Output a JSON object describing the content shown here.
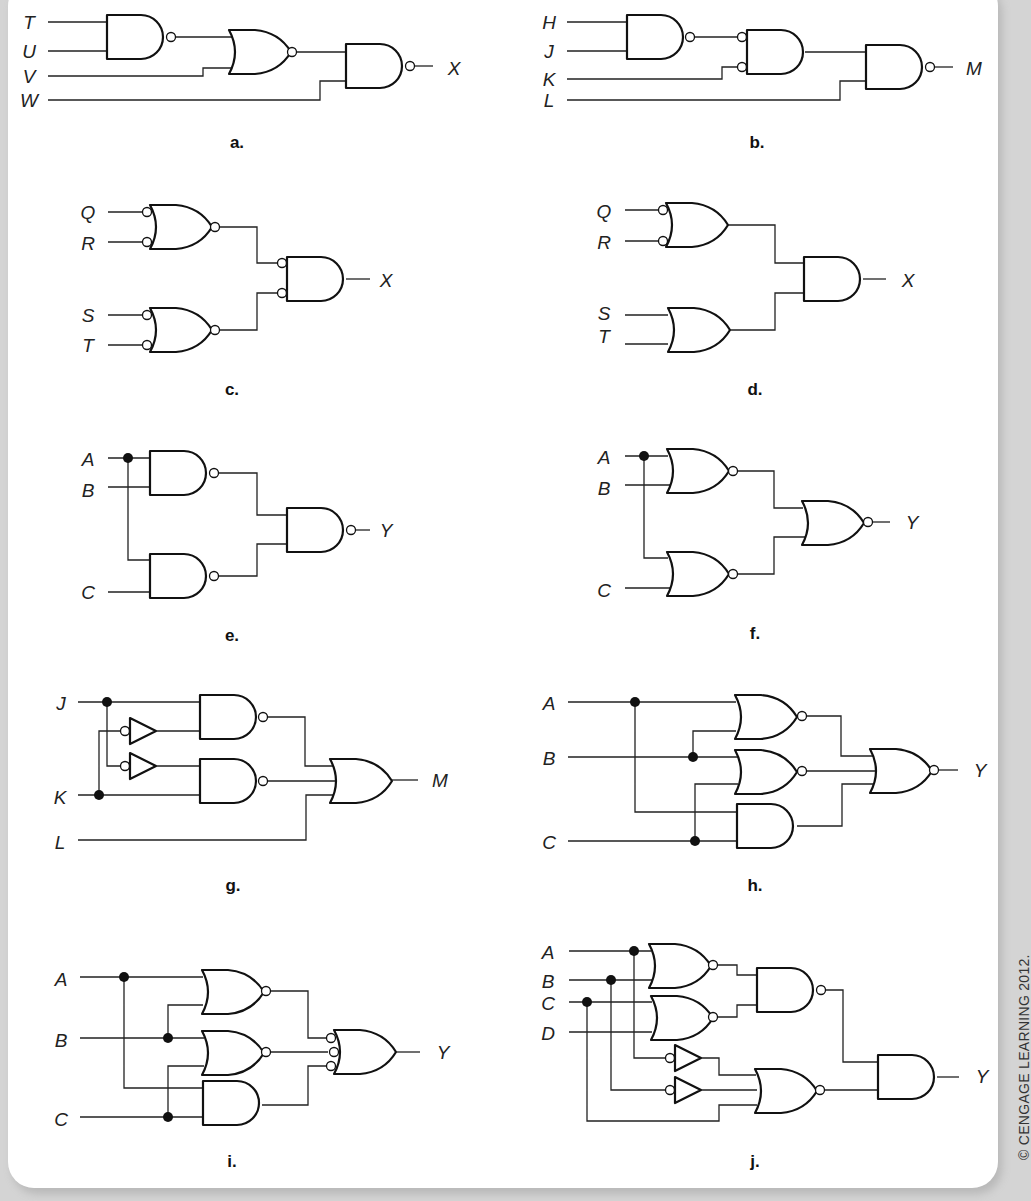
{
  "figure": {
    "credit": "© CENGAGE LEARNING 2012.",
    "panels": {
      "a": {
        "caption": "a.",
        "inputs": [
          "T",
          "U",
          "V",
          "W"
        ],
        "output": "X",
        "gates": [
          "NAND",
          "NOR",
          "NAND"
        ]
      },
      "b": {
        "caption": "b.",
        "inputs": [
          "H",
          "J",
          "K",
          "L"
        ],
        "output": "M",
        "gates": [
          "NAND",
          "AND (inverted inputs)",
          "NAND"
        ]
      },
      "c": {
        "caption": "c.",
        "inputs": [
          "Q",
          "R",
          "S",
          "T"
        ],
        "output": "X",
        "gates": [
          "NOR (inverted inputs)",
          "NOR (inverted inputs)",
          "AND (inverted inputs)"
        ]
      },
      "d": {
        "caption": "d.",
        "inputs": [
          "Q",
          "R",
          "S",
          "T"
        ],
        "output": "X",
        "gates": [
          "OR (inverted inputs)",
          "OR",
          "AND"
        ]
      },
      "e": {
        "caption": "e.",
        "inputs": [
          "A",
          "B",
          "C"
        ],
        "output": "Y",
        "gates": [
          "NAND",
          "NAND",
          "NAND"
        ]
      },
      "f": {
        "caption": "f.",
        "inputs": [
          "A",
          "B",
          "C"
        ],
        "output": "Y",
        "gates": [
          "NOR",
          "NOR",
          "NOR"
        ]
      },
      "g": {
        "caption": "g.",
        "inputs": [
          "J",
          "K",
          "L"
        ],
        "output": "M",
        "gates": [
          "NOT",
          "NOT",
          "NAND",
          "NAND",
          "OR"
        ]
      },
      "h": {
        "caption": "h.",
        "inputs": [
          "A",
          "B",
          "C"
        ],
        "output": "Y",
        "gates": [
          "NOR",
          "NOR",
          "AND",
          "NOR"
        ]
      },
      "i": {
        "caption": "i.",
        "inputs": [
          "A",
          "B",
          "C"
        ],
        "output": "Y",
        "gates": [
          "NOR",
          "NOR",
          "AND",
          "OR (inverted inputs)"
        ]
      },
      "j": {
        "caption": "j.",
        "inputs": [
          "A",
          "B",
          "C",
          "D"
        ],
        "output": "Y",
        "gates": [
          "NOR",
          "NOR",
          "NAND",
          "NOT",
          "NOT",
          "NOR",
          "AND"
        ]
      }
    }
  }
}
